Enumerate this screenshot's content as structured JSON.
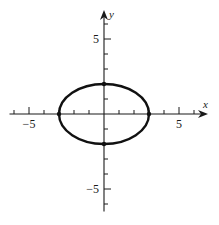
{
  "chart_data": {
    "type": "line",
    "title": "",
    "xlabel": "x",
    "ylabel": "y",
    "xlim": [
      -6.3,
      6.8
    ],
    "ylim": [
      -6.5,
      6.8
    ],
    "grid": false,
    "x_ticks": [
      -6,
      -5,
      -4,
      -3,
      -2,
      -1,
      1,
      2,
      3,
      4,
      5,
      6
    ],
    "y_ticks": [
      -6,
      -5,
      -4,
      -3,
      -2,
      -1,
      1,
      2,
      3,
      4,
      5,
      6
    ],
    "x_tick_labels": [
      {
        "value": -5,
        "text": "−5"
      },
      {
        "value": 5,
        "text": "5"
      }
    ],
    "y_tick_labels": [
      {
        "value": 5,
        "text": "5"
      },
      {
        "value": -5,
        "text": "−5"
      }
    ],
    "series": [
      {
        "name": "ellipse",
        "kind": "ellipse",
        "equation": "x^2/9 + y^2/4 = 1",
        "center": [
          0,
          0
        ],
        "semi_axis_x": 3,
        "semi_axis_y": 2
      }
    ],
    "marked_points": [
      {
        "x": -3,
        "y": 0
      },
      {
        "x": 3,
        "y": 0
      },
      {
        "x": 0,
        "y": 2
      },
      {
        "x": 0,
        "y": -2
      }
    ]
  }
}
